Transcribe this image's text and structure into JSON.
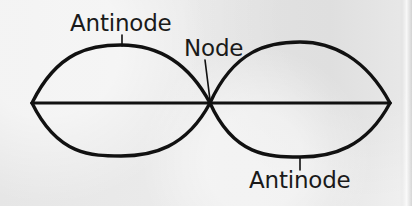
{
  "figure": {
    "name": "standing-wave-second-harmonic",
    "background_color": "#e9e9e9",
    "stroke_color": "#111111",
    "labels": {
      "antinode_top": "Antinode",
      "node": "Node",
      "antinode_bottom": "Antinode"
    }
  },
  "chart_data": {
    "type": "line",
    "title": "",
    "xlabel": "",
    "ylabel": "",
    "xlim": [
      32,
      390
    ],
    "ylim": [
      45,
      157
    ],
    "grid": false,
    "legend": null,
    "annotations": [
      {
        "text": "Antinode",
        "text_x": 70,
        "text_y": 12,
        "leader": {
          "x1": 122,
          "y1": 35,
          "x2": 122,
          "y2": 46
        },
        "target_x": 122,
        "target_y": 46
      },
      {
        "text": "Node",
        "text_x": 184,
        "text_y": 37,
        "leader": {
          "x1": 205,
          "y1": 60,
          "x2": 210,
          "y2": 100
        },
        "target_x": 210,
        "target_y": 103
      },
      {
        "text": "Antinode",
        "text_x": 249,
        "text_y": 169,
        "leader": {
          "x1": 300,
          "y1": 157,
          "x2": 300,
          "y2": 170
        },
        "target_x": 300,
        "target_y": 157
      }
    ],
    "series": [
      {
        "name": "equilibrium-axis",
        "path": "M 32 103 L 390 103",
        "values_x": [
          32,
          210,
          390
        ],
        "values_y": [
          103,
          103,
          103
        ]
      },
      {
        "name": "upper-envelope",
        "path": "M 32 103 C 58 50, 92 45, 121 45 C 152 45, 186 58, 210 103 C 234 50, 268 42, 300 42 C 332 42, 366 58, 390 103",
        "values_x": [
          32,
          121,
          210,
          300,
          390
        ],
        "values_y": [
          103,
          45,
          103,
          42,
          103
        ]
      },
      {
        "name": "lower-envelope",
        "path": "M 32 103 C 58 156, 92 156, 121 156 C 152 156, 186 148, 210 103 C 234 156, 268 157, 300 157 C 332 157, 366 148, 390 103",
        "values_x": [
          32,
          121,
          210,
          300,
          390
        ],
        "values_y": [
          103,
          156,
          103,
          157,
          103
        ]
      }
    ]
  }
}
